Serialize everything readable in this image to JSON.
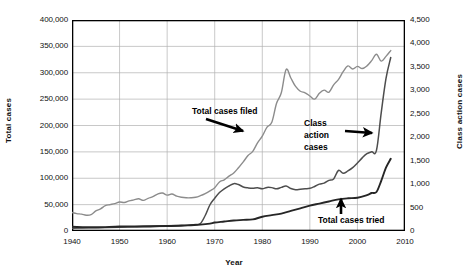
{
  "chart_data": {
    "type": "line",
    "title": "",
    "xlabel": "Year",
    "ylabel": "Total cases",
    "ylabel_secondary": "Class action cases",
    "xlim": [
      1940,
      2010
    ],
    "ylim": [
      0,
      400000
    ],
    "ylim_secondary": [
      0,
      4500
    ],
    "grid": true,
    "legend": "none (inline annotations with arrows)",
    "xticks": [
      "1940",
      "1950",
      "1960",
      "1970",
      "1980",
      "1990",
      "2000",
      "2010"
    ],
    "xtick_values": [
      1940,
      1950,
      1960,
      1970,
      1980,
      1990,
      2000,
      2010
    ],
    "yticks": [
      "0",
      "50,000",
      "100,000",
      "150,000",
      "200,000",
      "250,000",
      "300,000",
      "350,000",
      "400,000"
    ],
    "ytick_values": [
      0,
      50000,
      100000,
      150000,
      200000,
      250000,
      300000,
      350000,
      400000
    ],
    "yticks_secondary": [
      "0",
      "500",
      "1,000",
      "1,500",
      "2,000",
      "2,500",
      "3,000",
      "3,500",
      "4,000",
      "4,500"
    ],
    "ytick_values_secondary": [
      0,
      500,
      1000,
      1500,
      2000,
      2500,
      3000,
      3500,
      4000,
      4500
    ],
    "annotations": [
      {
        "text": "Total cases filed",
        "series": "total_cases_filed",
        "arrow": "down-right"
      },
      {
        "text": "Class action cases",
        "lines": [
          "Class",
          "action",
          "cases"
        ],
        "series": "class_action_cases",
        "arrow": "right"
      },
      {
        "text": "Total cases tried",
        "series": "total_cases_tried",
        "arrow": "up"
      }
    ],
    "series": [
      {
        "name": "Total cases filed",
        "axis": "left",
        "color": "#8c8c8c",
        "x": [
          1940,
          1941,
          1942,
          1943,
          1944,
          1945,
          1946,
          1947,
          1948,
          1949,
          1950,
          1951,
          1952,
          1953,
          1954,
          1955,
          1956,
          1957,
          1958,
          1959,
          1960,
          1961,
          1962,
          1963,
          1964,
          1965,
          1966,
          1967,
          1968,
          1969,
          1970,
          1971,
          1972,
          1973,
          1974,
          1975,
          1976,
          1977,
          1978,
          1979,
          1980,
          1981,
          1982,
          1983,
          1984,
          1985,
          1986,
          1987,
          1988,
          1989,
          1990,
          1991,
          1992,
          1993,
          1994,
          1995,
          1996,
          1997,
          1998,
          1999,
          2000,
          2001,
          2002,
          2003,
          2004,
          2005,
          2006,
          2007
        ],
        "values": [
          35000,
          33000,
          32000,
          30000,
          31000,
          38000,
          42000,
          48000,
          50000,
          52000,
          55000,
          54000,
          57000,
          59000,
          61000,
          58000,
          62000,
          65000,
          70000,
          72000,
          68000,
          70000,
          66000,
          64000,
          63000,
          63000,
          64000,
          67000,
          71000,
          76000,
          82000,
          93000,
          97000,
          104000,
          110000,
          120000,
          131000,
          143000,
          151000,
          167000,
          180000,
          197000,
          206000,
          242000,
          262000,
          306000,
          290000,
          274000,
          265000,
          262000,
          256000,
          250000,
          261000,
          267000,
          263000,
          277000,
          287000,
          302000,
          313000,
          307000,
          312000,
          308000,
          313000,
          323000,
          335000,
          322000,
          331000,
          342000
        ]
      },
      {
        "name": "Class action cases",
        "axis": "right",
        "color": "#4d4d4d",
        "x": [
          1940,
          1945,
          1950,
          1955,
          1960,
          1963,
          1965,
          1966,
          1967,
          1968,
          1969,
          1970,
          1971,
          1972,
          1973,
          1974,
          1975,
          1976,
          1977,
          1978,
          1979,
          1980,
          1981,
          1982,
          1983,
          1984,
          1985,
          1986,
          1987,
          1988,
          1989,
          1990,
          1991,
          1992,
          1993,
          1994,
          1995,
          1996,
          1997,
          1998,
          1999,
          2000,
          2001,
          2002,
          2003,
          2004,
          2005,
          2006,
          2007
        ],
        "values": [
          60,
          70,
          80,
          90,
          110,
          120,
          130,
          140,
          160,
          330,
          560,
          700,
          820,
          900,
          960,
          1010,
          990,
          940,
          920,
          910,
          920,
          900,
          930,
          925,
          900,
          930,
          960,
          905,
          880,
          890,
          900,
          910,
          950,
          1000,
          1020,
          1080,
          1110,
          1290,
          1230,
          1280,
          1350,
          1450,
          1560,
          1650,
          1690,
          1720,
          2520,
          3250,
          3700
        ]
      },
      {
        "name": "Total cases tried",
        "axis": "left",
        "color": "#262626",
        "x": [
          1940,
          1945,
          1950,
          1955,
          1960,
          1963,
          1965,
          1967,
          1969,
          1970,
          1972,
          1974,
          1976,
          1978,
          1980,
          1982,
          1984,
          1986,
          1988,
          1990,
          1992,
          1994,
          1996,
          1998,
          2000,
          2002,
          2003,
          2004,
          2005,
          2006,
          2007
        ],
        "values": [
          8000,
          7000,
          8500,
          9000,
          9500,
          10000,
          11000,
          12000,
          14000,
          16000,
          18000,
          20000,
          21000,
          22000,
          27000,
          30000,
          33000,
          38000,
          43000,
          48000,
          52000,
          56000,
          60000,
          62000,
          63000,
          68000,
          72000,
          74000,
          95000,
          120000,
          137000
        ]
      }
    ]
  },
  "axes": {
    "left_title": "Total cases",
    "right_title": "Class action cases",
    "x_title": "Year"
  },
  "annotations": {
    "filed": "Total cases filed",
    "class_line1": "Class",
    "class_line2": "action",
    "class_line3": "cases",
    "tried": "Total cases tried"
  }
}
